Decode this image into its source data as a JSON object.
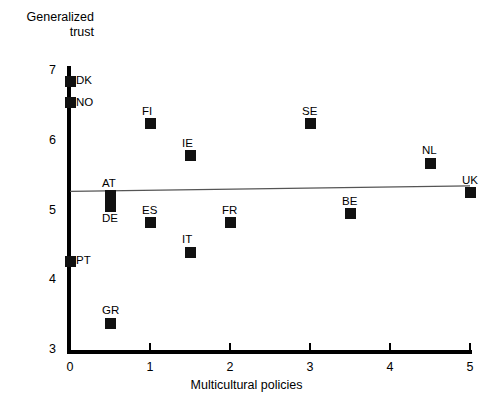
{
  "chart_data": {
    "type": "scatter",
    "title": "",
    "ylabel": "Generalized\ntrust",
    "xlabel": "Multicultural policies",
    "xlim": [
      0,
      5
    ],
    "ylim": [
      3,
      7
    ],
    "xticks": [
      "0",
      "1",
      "2",
      "3",
      "4",
      "5"
    ],
    "yticks": [
      "3",
      "4",
      "5",
      "6",
      "7"
    ],
    "grid": false,
    "legend": "none",
    "marker": "filled-square",
    "marker_color": "#111111",
    "trendline": {
      "type": "linear",
      "color": "#555555",
      "x0": 0.0,
      "y0": 5.26,
      "x1": 5.0,
      "y1": 5.34
    },
    "points": [
      {
        "label": "DK",
        "x": 0.0,
        "y": 6.84,
        "label_pos": "right"
      },
      {
        "label": "NO",
        "x": 0.0,
        "y": 6.53,
        "label_pos": "right"
      },
      {
        "label": "FI",
        "x": 1.0,
        "y": 6.23,
        "label_pos": "above"
      },
      {
        "label": "SE",
        "x": 3.0,
        "y": 6.23,
        "label_pos": "above"
      },
      {
        "label": "IE",
        "x": 1.5,
        "y": 5.77,
        "label_pos": "above"
      },
      {
        "label": "NL",
        "x": 4.5,
        "y": 5.66,
        "label_pos": "above"
      },
      {
        "label": "UK",
        "x": 5.0,
        "y": 5.24,
        "label_pos": "above"
      },
      {
        "label": "AT",
        "x": 0.5,
        "y": 5.2,
        "label_pos": "above"
      },
      {
        "label": "DE",
        "x": 0.5,
        "y": 5.05,
        "label_pos": "below"
      },
      {
        "label": "BE",
        "x": 3.5,
        "y": 4.94,
        "label_pos": "above"
      },
      {
        "label": "ES",
        "x": 1.0,
        "y": 4.81,
        "label_pos": "above"
      },
      {
        "label": "FR",
        "x": 2.0,
        "y": 4.81,
        "label_pos": "above"
      },
      {
        "label": "IT",
        "x": 1.5,
        "y": 4.39,
        "label_pos": "above"
      },
      {
        "label": "PT",
        "x": 0.0,
        "y": 4.26,
        "label_pos": "right"
      },
      {
        "label": "GR",
        "x": 0.5,
        "y": 3.37,
        "label_pos": "above"
      }
    ]
  }
}
